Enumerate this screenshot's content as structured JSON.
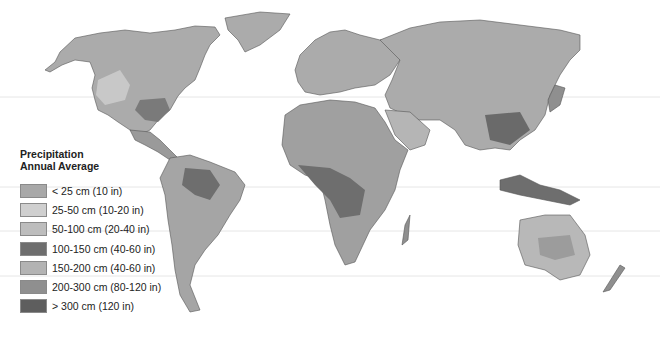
{
  "legend": {
    "title_line1": "Precipitation",
    "title_line2": "Annual Average",
    "items": [
      {
        "label": "< 25 cm (10 in)",
        "color": "#a8a8a8"
      },
      {
        "label": "25-50 cm (10-20 in)",
        "color": "#cfcfcf"
      },
      {
        "label": "50-100 cm (20-40 in)",
        "color": "#bdbdbd"
      },
      {
        "label": "100-150 cm (40-60 in)",
        "color": "#6e6e6e"
      },
      {
        "label": "150-200 cm (40-60 in)",
        "color": "#b3b3b3"
      },
      {
        "label": "200-300 cm (80-120 in)",
        "color": "#8f8f8f"
      },
      {
        "label": "> 300 cm (120 in)",
        "color": "#5e5e5e"
      }
    ]
  },
  "map": {
    "subject": "World map of annual average precipitation",
    "border_color": "#555555",
    "background": "#ffffff"
  }
}
